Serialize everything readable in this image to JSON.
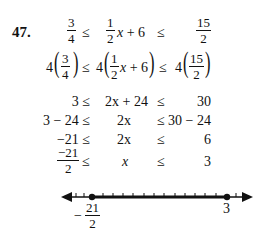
{
  "problem": {
    "number": "47.",
    "line1": {
      "left": {
        "num": "3",
        "den": "4"
      },
      "rel1": "≤",
      "mid": {
        "num": "1",
        "den": "2",
        "rest_var": "x",
        "rest": " + 6"
      },
      "rel2": "≤",
      "right": {
        "num": "15",
        "den": "2"
      }
    },
    "line2": {
      "coef": "4",
      "left": {
        "num": "3",
        "den": "4"
      },
      "rel1": "≤",
      "mid": {
        "num": "1",
        "den": "2",
        "rest_var": "x",
        "rest": " + 6"
      },
      "rel2": "≤",
      "right": {
        "num": "15",
        "den": "2"
      }
    },
    "line3": {
      "left": "3 ≤",
      "mid_var": "2x",
      "mid_rest": " + 24",
      "rel2": "≤",
      "right": "30"
    },
    "line4": {
      "left": "3 − 24 ≤",
      "mid": "2x",
      "right": "≤ 30 − 24"
    },
    "line5": {
      "left": "−21 ≤",
      "mid": "2x",
      "rel2": "≤",
      "right": "6"
    },
    "line6": {
      "left": {
        "num": "−21",
        "den": "2"
      },
      "rel1": "≤",
      "mid": "x",
      "rel2": "≤",
      "right": "3"
    }
  },
  "number_line": {
    "left_label": {
      "sign": "−",
      "num": "21",
      "den": "2"
    },
    "right_label": "3",
    "interval": "closed",
    "from": -10.5,
    "to": 3
  }
}
